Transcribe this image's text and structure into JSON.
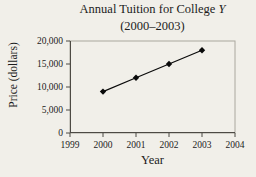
{
  "title": {
    "main": "Annual Tuition for College ",
    "italic_suffix": "Y",
    "subtitle": "(2000–2003)"
  },
  "chart_data": {
    "type": "line",
    "title": "Annual Tuition for College Y (2000–2003)",
    "xlabel": "Year",
    "ylabel": "Price (dollars)",
    "x": [
      2000,
      2001,
      2002,
      2003
    ],
    "values": [
      9000,
      12000,
      15000,
      18000
    ],
    "series": [
      {
        "name": "Annual tuition",
        "values": [
          9000,
          12000,
          15000,
          18000
        ]
      }
    ],
    "xlim": [
      1999,
      2004
    ],
    "ylim": [
      0,
      20000
    ],
    "xticks": [
      1999,
      2000,
      2001,
      2002,
      2003,
      2004
    ],
    "xtick_labels": [
      "1999",
      "2000",
      "2001",
      "2002",
      "2003",
      "2004"
    ],
    "yticks": [
      0,
      5000,
      10000,
      15000,
      20000
    ],
    "ytick_labels": [
      "0",
      "5,000",
      "10,000",
      "15,000",
      "20,000"
    ],
    "marker": "diamond",
    "grid": false,
    "legend": false
  },
  "colors": {
    "background": "#f1efe9",
    "text": "#1c1c1c",
    "line": "#0a0a0a",
    "marker": "#0a0a0a",
    "plot_border": "#aaa79e",
    "axis": "#4d4a44"
  }
}
